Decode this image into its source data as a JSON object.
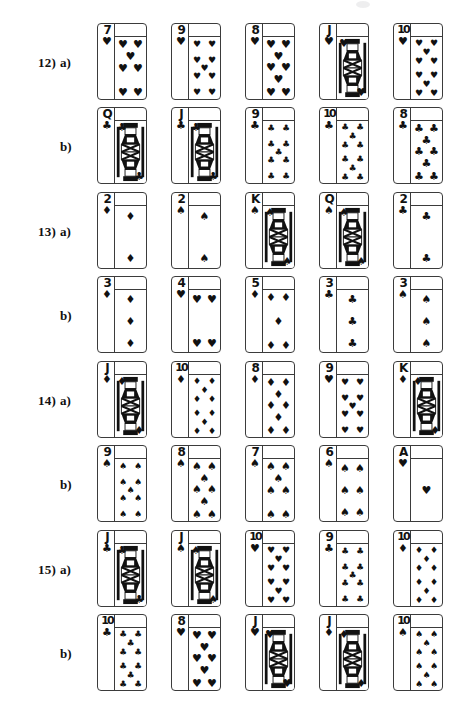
{
  "page": {
    "background_color": "#ffffff",
    "ink_color": "#111111",
    "card_border_color": "#3b3b3b",
    "suit_glyphs": {
      "hearts": "♥",
      "spades": "♠",
      "diamonds": "♦",
      "clubs": "♣"
    }
  },
  "problems": [
    {
      "number": "12)",
      "parts": [
        {
          "label": "a)",
          "cards": [
            {
              "rank": "7",
              "suit": "hearts",
              "type": "number"
            },
            {
              "rank": "9",
              "suit": "hearts",
              "type": "number"
            },
            {
              "rank": "8",
              "suit": "hearts",
              "type": "number"
            },
            {
              "rank": "J",
              "suit": "hearts",
              "type": "court"
            },
            {
              "rank": "10",
              "suit": "hearts",
              "type": "number"
            }
          ]
        },
        {
          "label": "b)",
          "cards": [
            {
              "rank": "Q",
              "suit": "clubs",
              "type": "court"
            },
            {
              "rank": "J",
              "suit": "clubs",
              "type": "court"
            },
            {
              "rank": "9",
              "suit": "clubs",
              "type": "number"
            },
            {
              "rank": "10",
              "suit": "clubs",
              "type": "number"
            },
            {
              "rank": "8",
              "suit": "clubs",
              "type": "number"
            }
          ]
        }
      ]
    },
    {
      "number": "13)",
      "parts": [
        {
          "label": "a)",
          "cards": [
            {
              "rank": "2",
              "suit": "diamonds",
              "type": "number"
            },
            {
              "rank": "2",
              "suit": "spades",
              "type": "number"
            },
            {
              "rank": "K",
              "suit": "spades",
              "type": "court"
            },
            {
              "rank": "Q",
              "suit": "spades",
              "type": "court"
            },
            {
              "rank": "2",
              "suit": "clubs",
              "type": "number"
            }
          ]
        },
        {
          "label": "b)",
          "cards": [
            {
              "rank": "3",
              "suit": "diamonds",
              "type": "number"
            },
            {
              "rank": "4",
              "suit": "hearts",
              "type": "number"
            },
            {
              "rank": "5",
              "suit": "diamonds",
              "type": "number"
            },
            {
              "rank": "3",
              "suit": "clubs",
              "type": "number"
            },
            {
              "rank": "3",
              "suit": "spades",
              "type": "number"
            }
          ]
        }
      ]
    },
    {
      "number": "14)",
      "parts": [
        {
          "label": "a)",
          "cards": [
            {
              "rank": "J",
              "suit": "diamonds",
              "type": "court"
            },
            {
              "rank": "10",
              "suit": "diamonds",
              "type": "number"
            },
            {
              "rank": "8",
              "suit": "diamonds",
              "type": "number"
            },
            {
              "rank": "9",
              "suit": "hearts",
              "type": "number"
            },
            {
              "rank": "K",
              "suit": "diamonds",
              "type": "court"
            }
          ]
        },
        {
          "label": "b)",
          "cards": [
            {
              "rank": "9",
              "suit": "spades",
              "type": "number"
            },
            {
              "rank": "8",
              "suit": "spades",
              "type": "number"
            },
            {
              "rank": "7",
              "suit": "spades",
              "type": "number"
            },
            {
              "rank": "6",
              "suit": "spades",
              "type": "number"
            },
            {
              "rank": "A",
              "suit": "hearts",
              "type": "number"
            }
          ]
        }
      ]
    },
    {
      "number": "15)",
      "parts": [
        {
          "label": "a)",
          "cards": [
            {
              "rank": "J",
              "suit": "clubs",
              "type": "court"
            },
            {
              "rank": "J",
              "suit": "spades",
              "type": "court"
            },
            {
              "rank": "10",
              "suit": "hearts",
              "type": "number"
            },
            {
              "rank": "9",
              "suit": "clubs",
              "type": "number"
            },
            {
              "rank": "10",
              "suit": "diamonds",
              "type": "number"
            }
          ]
        },
        {
          "label": "b)",
          "cards": [
            {
              "rank": "10",
              "suit": "clubs",
              "type": "number"
            },
            {
              "rank": "8",
              "suit": "hearts",
              "type": "number"
            },
            {
              "rank": "J",
              "suit": "hearts",
              "type": "court"
            },
            {
              "rank": "J",
              "suit": "diamonds",
              "type": "court"
            },
            {
              "rank": "10",
              "suit": "spades",
              "type": "number"
            }
          ]
        }
      ]
    }
  ]
}
